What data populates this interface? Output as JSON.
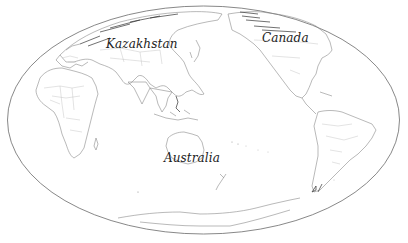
{
  "map": {
    "projection": "Mollweide (Pacific-centered)",
    "style": "outline",
    "colors": {
      "background": "#ffffff",
      "coastline": "#8a8a8a",
      "border": "#b8b8b8",
      "frame": "#6a6a6a",
      "label": "#222222"
    },
    "labels": [
      {
        "text": "Kazakhstan",
        "x": 106,
        "y": 36
      },
      {
        "text": "Canada",
        "x": 262,
        "y": 30
      },
      {
        "text": "Australia",
        "x": 164,
        "y": 150
      }
    ]
  }
}
